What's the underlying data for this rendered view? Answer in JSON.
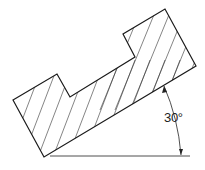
{
  "figure": {
    "angle_label": "30°",
    "colors": {
      "line": "#1a1a1a",
      "background": "#ffffff"
    }
  }
}
